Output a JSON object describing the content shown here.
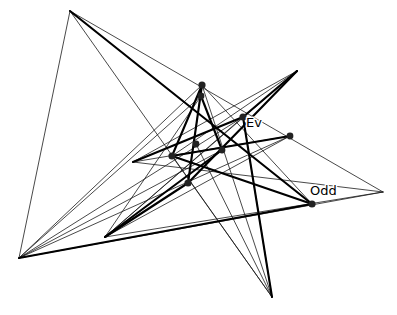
{
  "figure": {
    "kind": "line-configuration-diagram",
    "background_color": "#ffffff",
    "line_color": "#1b1b1b",
    "emphasis_line_color": "#000000",
    "vertex_color": "#222222",
    "width": 397,
    "height": 315,
    "labels": [
      {
        "name": "label-ev",
        "text": "Ev",
        "x": 246,
        "y": 127
      },
      {
        "name": "label-odd",
        "text": "Odd",
        "x": 310,
        "y": 195
      }
    ],
    "vertices": [
      {
        "name": "vertex-top-apex",
        "x": 70,
        "y": 11,
        "r": 0,
        "marked": false
      },
      {
        "name": "vertex-upper-a",
        "x": 202,
        "y": 85,
        "r": 3.6,
        "marked": true
      },
      {
        "name": "vertex-upper-b",
        "x": 201,
        "y": 96,
        "r": 3.4,
        "marked": true
      },
      {
        "name": "vertex-spike-topright",
        "x": 297,
        "y": 71,
        "r": 0,
        "marked": false
      },
      {
        "name": "vertex-ev",
        "x": 243,
        "y": 117,
        "r": 3.6,
        "marked": true
      },
      {
        "name": "vertex-right-mid",
        "x": 290,
        "y": 136,
        "r": 3.4,
        "marked": true
      },
      {
        "name": "vertex-center-right",
        "x": 222,
        "y": 150,
        "r": 3.4,
        "marked": true
      },
      {
        "name": "vertex-center-left",
        "x": 196,
        "y": 144,
        "r": 3.4,
        "marked": true
      },
      {
        "name": "vertex-left-mid",
        "x": 172,
        "y": 156,
        "r": 3.6,
        "marked": true
      },
      {
        "name": "vertex-lower-center",
        "x": 188,
        "y": 183,
        "r": 3.6,
        "marked": true
      },
      {
        "name": "vertex-odd",
        "x": 312,
        "y": 204,
        "r": 3.6,
        "marked": true
      },
      {
        "name": "vertex-right-apex",
        "x": 383,
        "y": 192,
        "r": 0,
        "marked": false
      },
      {
        "name": "vertex-left-apex",
        "x": 19,
        "y": 258,
        "r": 0,
        "marked": false
      },
      {
        "name": "vertex-bottom-junction",
        "x": 105,
        "y": 237,
        "r": 0,
        "marked": false
      },
      {
        "name": "vertex-bottom-apex",
        "x": 272,
        "y": 297,
        "r": 0,
        "marked": false
      }
    ],
    "thin_segments": [
      {
        "name": "thin-topapex-rightapex",
        "x1": 70,
        "y1": 11,
        "x2": 383,
        "y2": 192
      },
      {
        "name": "thin-topapex-bottomapex",
        "x1": 70,
        "y1": 11,
        "x2": 272,
        "y2": 297
      },
      {
        "name": "thin-topapex-leftapex",
        "x1": 70,
        "y1": 11,
        "x2": 19,
        "y2": 258
      },
      {
        "name": "thin-topapex-oddpt",
        "x1": 70,
        "y1": 11,
        "x2": 312,
        "y2": 204
      },
      {
        "name": "thin-upperA-leftapex",
        "x1": 202,
        "y1": 85,
        "x2": 19,
        "y2": 258
      },
      {
        "name": "thin-upperA-oddpt",
        "x1": 202,
        "y1": 85,
        "x2": 312,
        "y2": 204
      },
      {
        "name": "thin-upperA-bottomapex",
        "x1": 202,
        "y1": 85,
        "x2": 272,
        "y2": 297
      },
      {
        "name": "thin-upperB-leftapex",
        "x1": 201,
        "y1": 96,
        "x2": 19,
        "y2": 258
      },
      {
        "name": "thin-spike-leftmid",
        "x1": 297,
        "y1": 71,
        "x2": 133,
        "y2": 162
      },
      {
        "name": "thin-spike-bottomjunc",
        "x1": 297,
        "y1": 71,
        "x2": 105,
        "y2": 237
      },
      {
        "name": "thin-ev-leftapex",
        "x1": 243,
        "y1": 117,
        "x2": 19,
        "y2": 258
      },
      {
        "name": "thin-ev-bottomapex",
        "x1": 243,
        "y1": 117,
        "x2": 272,
        "y2": 297
      },
      {
        "name": "thin-rightmid-leftmid",
        "x1": 290,
        "y1": 136,
        "x2": 133,
        "y2": 162
      },
      {
        "name": "thin-rightmid-bottomjnc",
        "x1": 290,
        "y1": 136,
        "x2": 105,
        "y2": 237
      },
      {
        "name": "thin-rightapex-leftmid",
        "x1": 383,
        "y1": 192,
        "x2": 133,
        "y2": 162
      },
      {
        "name": "thin-rightapex-bottomjc",
        "x1": 383,
        "y1": 192,
        "x2": 105,
        "y2": 237
      },
      {
        "name": "thin-rightapex-leftapex",
        "x1": 383,
        "y1": 192,
        "x2": 19,
        "y2": 258
      },
      {
        "name": "thin-leftapex-rightmid2",
        "x1": 19,
        "y1": 258,
        "x2": 290,
        "y2": 136
      },
      {
        "name": "thin-leftmid-bottomapex",
        "x1": 172,
        "y1": 156,
        "x2": 272,
        "y2": 297
      },
      {
        "name": "thin-centerleft-botapex",
        "x1": 196,
        "y1": 144,
        "x2": 272,
        "y2": 297
      },
      {
        "name": "thin-upperA-lowercenter",
        "x1": 202,
        "y1": 85,
        "x2": 188,
        "y2": 183
      },
      {
        "name": "thin-lowercenter-spike",
        "x1": 188,
        "y1": 183,
        "x2": 297,
        "y2": 71
      },
      {
        "name": "thin-leftmid-spike2",
        "x1": 172,
        "y1": 156,
        "x2": 297,
        "y2": 71
      },
      {
        "name": "thin-bottomjunc-upperB",
        "x1": 105,
        "y1": 237,
        "x2": 201,
        "y2": 96
      },
      {
        "name": "thin-bottomjunc-ev",
        "x1": 105,
        "y1": 237,
        "x2": 243,
        "y2": 117
      },
      {
        "name": "thin-leftapex-centerlt",
        "x1": 19,
        "y1": 258,
        "x2": 222,
        "y2": 150
      }
    ],
    "thick_segments": [
      {
        "name": "thick-topapex-oddpt",
        "x1": 70,
        "y1": 11,
        "x2": 312,
        "y2": 204
      },
      {
        "name": "thick-leftapex-oddpt",
        "x1": 19,
        "y1": 258,
        "x2": 312,
        "y2": 204
      },
      {
        "name": "thick-oddpt-leftmid",
        "x1": 312,
        "y1": 204,
        "x2": 172,
        "y2": 156
      },
      {
        "name": "thick-spike-evpoint",
        "x1": 297,
        "y1": 71,
        "x2": 243,
        "y2": 117
      },
      {
        "name": "thick-evpoint-bottomapex",
        "x1": 243,
        "y1": 117,
        "x2": 272,
        "y2": 297
      },
      {
        "name": "thick-upperA-lowercenter",
        "x1": 202,
        "y1": 85,
        "x2": 188,
        "y2": 183
      },
      {
        "name": "thick-lowercenter-botjnc",
        "x1": 188,
        "y1": 183,
        "x2": 105,
        "y2": 237
      },
      {
        "name": "thick-upperB-centerright",
        "x1": 201,
        "y1": 96,
        "x2": 222,
        "y2": 150
      },
      {
        "name": "thick-leftmid-upperA",
        "x1": 172,
        "y1": 156,
        "x2": 202,
        "y2": 85
      },
      {
        "name": "thick-ev-leftmid",
        "x1": 243,
        "y1": 117,
        "x2": 133,
        "y2": 162
      },
      {
        "name": "thick-centerright-botjunc",
        "x1": 222,
        "y1": 150,
        "x2": 105,
        "y2": 237
      },
      {
        "name": "thick-leftmid-rightmid",
        "x1": 172,
        "y1": 156,
        "x2": 290,
        "y2": 136
      },
      {
        "name": "thick-spike-lowercenter",
        "x1": 297,
        "y1": 71,
        "x2": 188,
        "y2": 183
      }
    ]
  }
}
